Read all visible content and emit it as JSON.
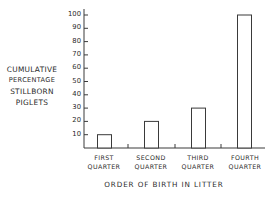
{
  "chart_data": {
    "type": "bar",
    "title": "",
    "xlabel": "ORDER OF BIRTH IN LITTER",
    "ylabel": "CUMULATIVE PERCENTAGE STILLBORN PIGLETS",
    "ylabel_lines": [
      "CUMULATIVE",
      "PERCENTAGE",
      "STILLBORN",
      "PIGLETS"
    ],
    "categories": [
      "FIRST QUARTER",
      "SECOND QUARTER",
      "THIRD QUARTER",
      "FOURTH QUARTER"
    ],
    "category_lines": [
      [
        "FIRST",
        "QUARTER"
      ],
      [
        "SECOND",
        "QUARTER"
      ],
      [
        "THIRD",
        "QUARTER"
      ],
      [
        "FOURTH",
        "QUARTER"
      ]
    ],
    "values": [
      10,
      20,
      30,
      100
    ],
    "ylim": [
      0,
      100
    ],
    "yticks": [
      10,
      20,
      30,
      40,
      50,
      60,
      70,
      80,
      90,
      100
    ],
    "ytick_labels": [
      "10",
      "20",
      "30",
      "40",
      "50",
      "60",
      "70",
      "80",
      "90",
      "100"
    ],
    "grid": false,
    "legend": null,
    "bar_style": "outline",
    "colors": {
      "line": "#3a3a3a",
      "fill": "#ffffff"
    }
  }
}
